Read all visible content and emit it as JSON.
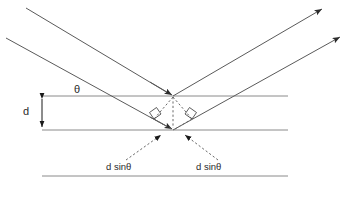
{
  "diagram": {
    "labels": {
      "spacing": "d",
      "angle": "θ",
      "path_difference_left": "d sinθ",
      "path_difference_right": "d sinθ"
    },
    "icon_names": {
      "incident_ray_upper": "incident-ray-arrow",
      "incident_ray_lower": "incident-ray-arrow",
      "reflected_ray_upper": "reflected-ray-arrow",
      "reflected_ray_lower": "reflected-ray-arrow",
      "right_angle_left": "right-angle-marker",
      "right_angle_right": "right-angle-marker",
      "spacing_arrow": "double-headed-arrow"
    },
    "colors": {
      "plane": "#8a8a8a",
      "ray": "#5a5a5a",
      "dashed": "#6a6a6a",
      "dimension": "#1a1a1a",
      "text": "#2b2b2b",
      "background": "#ffffff"
    },
    "geometry": {
      "planes": [
        {
          "name": "plane-1-top",
          "y": 96,
          "x1": 42,
          "x2": 288
        },
        {
          "name": "plane-2-middle",
          "y": 130,
          "x1": 42,
          "x2": 288
        },
        {
          "name": "plane-3-bottom",
          "y": 176,
          "x1": 42,
          "x2": 288
        }
      ],
      "scatter_point_upper": {
        "x": 173,
        "y": 96
      },
      "scatter_point_lower": {
        "x": 173,
        "y": 130
      },
      "incident_rays": [
        {
          "name": "ray-a-in",
          "x1": 26,
          "y1": 8,
          "x2": 173,
          "y2": 96
        },
        {
          "name": "ray-b-in",
          "x1": 6,
          "y1": 38,
          "x2": 173,
          "y2": 130
        }
      ],
      "reflected_rays": [
        {
          "name": "ray-a-out",
          "x1": 173,
          "y1": 96,
          "x2": 322,
          "y2": 9
        },
        {
          "name": "ray-b-out",
          "x1": 173,
          "y1": 130,
          "x2": 340,
          "y2": 37
        }
      ],
      "path_segments": [
        {
          "name": "segment-left",
          "x1": 173,
          "y1": 96,
          "x2": 155,
          "y2": 117
        },
        {
          "name": "segment-right",
          "x1": 173,
          "y1": 96,
          "x2": 191,
          "y2": 117
        }
      ],
      "normal_dashed": {
        "x1": 173,
        "y1": 96,
        "x2": 173,
        "y2": 130
      },
      "leader_left": {
        "x1": 130,
        "y1": 158,
        "x2": 160,
        "y2": 136
      },
      "leader_right": {
        "x1": 214,
        "y1": 158,
        "x2": 186,
        "y2": 136
      },
      "spacing_dimension": {
        "x": 42,
        "y_top": 96,
        "y_bottom": 130
      },
      "angle_label_position": {
        "x": 80,
        "y": 90
      }
    }
  }
}
